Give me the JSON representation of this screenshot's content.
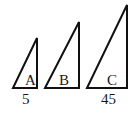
{
  "diagram": {
    "triangles": [
      {
        "label": "A",
        "base_label": "5",
        "points": "13,88 37,38 37,88",
        "label_x": 25,
        "label_y": 84
      },
      {
        "label": "B",
        "base_label": "",
        "points": "45,88 79,22 79,88",
        "label_x": 65,
        "label_y": 84
      },
      {
        "label": "C",
        "base_label": "45",
        "points": "87,88 127,5 127,88",
        "label_x": 110,
        "label_y": 84
      }
    ],
    "base_labels": [
      {
        "text": "5",
        "x": 22,
        "y": 104
      },
      {
        "text": "45",
        "x": 101,
        "y": 104
      }
    ],
    "colors": {
      "stroke": "#111111",
      "background": "#ffffff"
    }
  }
}
